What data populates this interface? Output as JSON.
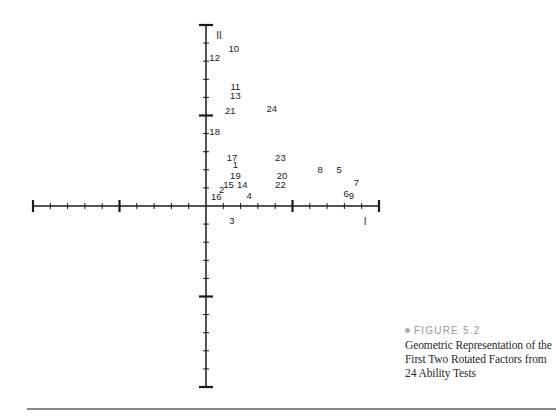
{
  "chart_data": {
    "type": "scatter",
    "title": "Geometric Representation of the First Two Rotated Factors from 24 Ability Tests",
    "figure_label": "FIGURE 5.2",
    "xlabel": "I",
    "ylabel": "II",
    "xlim": [
      -1.0,
      1.0
    ],
    "ylim": [
      -1.0,
      1.0
    ],
    "x_major_ticks": [
      -1.0,
      -0.5,
      0,
      0.5,
      1.0
    ],
    "y_major_ticks": [
      -1.0,
      -0.5,
      0,
      0.5,
      1.0
    ],
    "minor_tick_step": 0.1,
    "grid": false,
    "legend": null,
    "points": [
      {
        "label": "1",
        "x": 0.17,
        "y": 0.23
      },
      {
        "label": "2",
        "x": 0.09,
        "y": 0.09
      },
      {
        "label": "3",
        "x": 0.15,
        "y": -0.08
      },
      {
        "label": "4",
        "x": 0.25,
        "y": 0.06
      },
      {
        "label": "5",
        "x": 0.77,
        "y": 0.2
      },
      {
        "label": "6",
        "x": 0.81,
        "y": 0.07
      },
      {
        "label": "7",
        "x": 0.87,
        "y": 0.13
      },
      {
        "label": "8",
        "x": 0.66,
        "y": 0.2
      },
      {
        "label": "9",
        "x": 0.84,
        "y": 0.06
      },
      {
        "label": "10",
        "x": 0.16,
        "y": 0.87
      },
      {
        "label": "11",
        "x": 0.17,
        "y": 0.66
      },
      {
        "label": "12",
        "x": 0.05,
        "y": 0.82
      },
      {
        "label": "13",
        "x": 0.17,
        "y": 0.61
      },
      {
        "label": "14",
        "x": 0.21,
        "y": 0.12
      },
      {
        "label": "15",
        "x": 0.13,
        "y": 0.12
      },
      {
        "label": "16",
        "x": 0.06,
        "y": 0.05
      },
      {
        "label": "17",
        "x": 0.15,
        "y": 0.27
      },
      {
        "label": "18",
        "x": 0.05,
        "y": 0.41
      },
      {
        "label": "19",
        "x": 0.17,
        "y": 0.17
      },
      {
        "label": "20",
        "x": 0.44,
        "y": 0.17
      },
      {
        "label": "21",
        "x": 0.14,
        "y": 0.53
      },
      {
        "label": "22",
        "x": 0.43,
        "y": 0.12
      },
      {
        "label": "23",
        "x": 0.43,
        "y": 0.27
      },
      {
        "label": "24",
        "x": 0.38,
        "y": 0.54
      }
    ]
  },
  "caption": {
    "figure_label": "FIGURE 5.2",
    "text": "Geometric Representation of the First Two Rotated Factors from 24 Ability Tests"
  },
  "style": {
    "axis_color": "#1a1a1a",
    "caption_label_color": "#9a9a9a",
    "rule_color": "#888888"
  }
}
